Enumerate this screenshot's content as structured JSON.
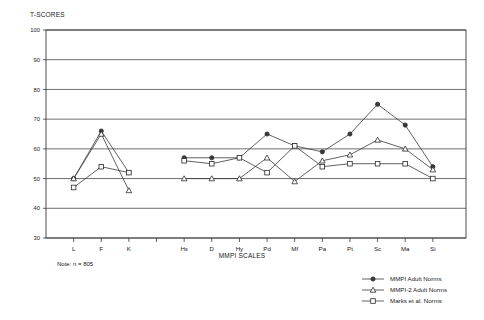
{
  "chart_data": {
    "type": "line",
    "title": "",
    "xlabel": "MMPI SCALES",
    "ylabel": "T-SCORES",
    "ylim": [
      30,
      100
    ],
    "yticks": [
      30,
      40,
      50,
      60,
      70,
      80,
      90,
      100
    ],
    "grid": true,
    "legend_position": "bottom-right",
    "categories": [
      "L",
      "F",
      "K",
      "Hs",
      "D",
      "Hy",
      "Pd",
      "Mf",
      "Pa",
      "Pt",
      "Sc",
      "Ma",
      "Si"
    ],
    "category_groups": [
      [
        "L",
        "F",
        "K"
      ],
      [
        "Hs",
        "D",
        "Hy",
        "Pd",
        "Mf",
        "Pa",
        "Pt",
        "Sc",
        "Ma",
        "Si"
      ]
    ],
    "series": [
      {
        "name": "MMPI Adult Norms",
        "marker": "circle",
        "values": [
          50,
          66,
          52,
          57,
          57,
          57,
          65,
          61,
          59,
          65,
          75,
          68,
          54
        ]
      },
      {
        "name": "MMPI-2 Adult Norms",
        "marker": "triangle",
        "values": [
          50,
          65,
          46,
          50,
          50,
          50,
          57,
          49,
          56,
          58,
          63,
          60,
          53
        ]
      },
      {
        "name": "Marks et al. Norms",
        "marker": "square",
        "values": [
          47,
          54,
          52,
          56,
          55,
          57,
          52,
          61,
          54,
          55,
          55,
          55,
          50
        ]
      }
    ],
    "annotations": [
      {
        "name": "sample-size-note",
        "text": "Note: n = 805"
      }
    ]
  },
  "axes": {
    "y_label": "T-SCORES",
    "x_label": "MMPI SCALES",
    "y_ticks": [
      "100",
      "90",
      "80",
      "70",
      "60",
      "50",
      "40",
      "30"
    ],
    "x_ticks": [
      "L",
      "F",
      "K",
      "Hs",
      "D",
      "Hy",
      "Pd",
      "Mf",
      "Pa",
      "Pt",
      "Sc",
      "Ma",
      "Si"
    ]
  },
  "legend": {
    "items": [
      {
        "label": "MMPI Adult Norms",
        "marker": "circle"
      },
      {
        "label": "MMPI-2 Adult Norms",
        "marker": "triangle"
      },
      {
        "label": "Marks et al. Norms",
        "marker": "square"
      }
    ]
  },
  "note": {
    "text": "Note: n = 805"
  },
  "colors": {
    "line": "#3a3a3a",
    "grid": "#4a4a4a",
    "frame": "#3a3a3a",
    "text": "#1a1a1a",
    "background": "#ffffff"
  }
}
